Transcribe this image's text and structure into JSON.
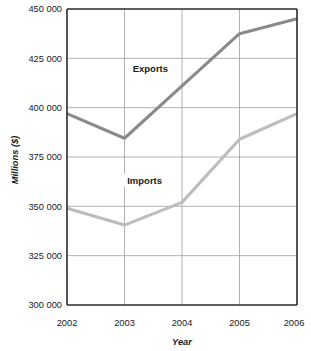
{
  "chart_data": {
    "type": "line",
    "title": "",
    "xlabel": "Year",
    "ylabel": "Millions ($)",
    "categories": [
      "2002",
      "2003",
      "2004",
      "2005",
      "2006"
    ],
    "x": [
      2002,
      2003,
      2004,
      2005,
      2006
    ],
    "xlim": [
      2002,
      2006
    ],
    "ylim": [
      300000,
      450000
    ],
    "ytick_step": 25000,
    "ytick_labels": [
      "450 000",
      "425 000",
      "400 000",
      "375 000",
      "350 000",
      "325 000",
      "300 000"
    ],
    "ytick_values": [
      450000,
      425000,
      400000,
      375000,
      350000,
      325000,
      300000
    ],
    "grid": "both",
    "legend": "inline-labels",
    "series": [
      {
        "name": "Exports",
        "label": "Exports",
        "color": "#8a8a8a",
        "values": [
          397000,
          384500,
          411000,
          437500,
          445000
        ]
      },
      {
        "name": "Imports",
        "label": "Imports",
        "color": "#bdbdbd",
        "values": [
          349000,
          340500,
          352000,
          384000,
          397000
        ]
      }
    ],
    "annotations": [
      {
        "text": "Exports",
        "x": 2003.45,
        "y": 418000
      },
      {
        "text": "Imports",
        "x": 2003.35,
        "y": 361500
      }
    ]
  },
  "colors": {
    "exports": "#8a8a8a",
    "imports": "#bdbdbd",
    "axis": "#2b2b2b",
    "grid": "#9e9e9e",
    "background": "#ffffff",
    "text": "#1a1a1a"
  }
}
